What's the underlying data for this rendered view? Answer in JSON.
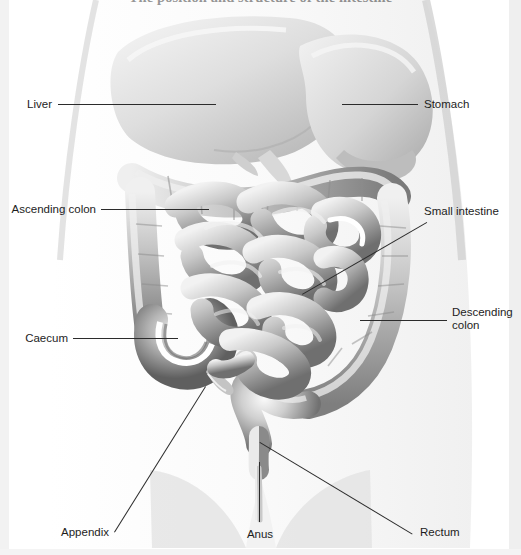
{
  "document": {
    "title": "The position and structure of the intestine",
    "figure_type": "anatomical-diagram",
    "subject": "human abdominal digestive organs",
    "style": "grayscale medical illustration",
    "colors": {
      "background": "#ffffff",
      "line": "#2b2b2b",
      "text": "#1d1d1d",
      "organ_light": "#e9e9e9",
      "organ_mid": "#b9b9b9",
      "organ_dark": "#6e6e6e"
    }
  },
  "labels": [
    {
      "id": "liver",
      "text": "Liver",
      "side": "left",
      "x": 22,
      "y": 98,
      "line_x1": 58,
      "line_y1": 104,
      "line_x2": 216,
      "line_y2": 104
    },
    {
      "id": "stomach",
      "text": "Stomach",
      "side": "right",
      "x": 424,
      "y": 98,
      "line_x1": 342,
      "line_y1": 104,
      "line_x2": 418,
      "line_y2": 104
    },
    {
      "id": "ascending-colon",
      "text": "Ascending colon",
      "side": "left",
      "x": 14,
      "y": 203,
      "line_x1": 101,
      "line_y1": 209,
      "line_x2": 209,
      "line_y2": 209
    },
    {
      "id": "small-intestine",
      "text": "Small intestine",
      "side": "right",
      "x": 424,
      "y": 205,
      "line_x1": 302,
      "line_y1": 294,
      "line_x2": 418,
      "line_y2": 211
    },
    {
      "id": "descending-colon",
      "text": "Descending colon",
      "side": "right",
      "x": 452,
      "y": 306,
      "line_x1": 360,
      "line_y1": 320,
      "line_x2": 447,
      "line_y2": 320
    },
    {
      "id": "caecum",
      "text": "Caecum",
      "side": "left",
      "x": 26,
      "y": 332,
      "line_x1": 73,
      "line_y1": 338,
      "line_x2": 178,
      "line_y2": 338
    },
    {
      "id": "appendix",
      "text": "Appendix",
      "side": "left",
      "x": 56,
      "y": 526,
      "line_x1": 114,
      "line_y1": 532,
      "line_x2": 205,
      "line_y2": 386
    },
    {
      "id": "anus",
      "text": "Anus",
      "side": "below",
      "x": 248,
      "y": 528,
      "line_x1": 259,
      "line_y1": 462,
      "line_x2": 259,
      "line_y2": 522
    },
    {
      "id": "rectum",
      "text": "Rectum",
      "side": "right",
      "x": 420,
      "y": 526,
      "line_x1": 260,
      "line_y1": 442,
      "line_x2": 414,
      "line_y2": 532
    }
  ],
  "label_text": {
    "liver": "Liver",
    "stomach": "Stomach",
    "ascending_colon": "Ascending colon",
    "small_intestine": "Small intestine",
    "descending_colon_line1": "Descending",
    "descending_colon_line2": "colon",
    "caecum": "Caecum",
    "appendix": "Appendix",
    "anus": "Anus",
    "rectum": "Rectum"
  }
}
